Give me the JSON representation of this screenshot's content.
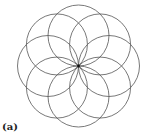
{
  "figure": {
    "label": "(a)",
    "circle_count": 8,
    "center": [
      78.5,
      66
    ],
    "circle_radius": 30.5,
    "start_angle_deg": -90,
    "stroke_color": "#555555",
    "center_dot_color": "#111111"
  }
}
